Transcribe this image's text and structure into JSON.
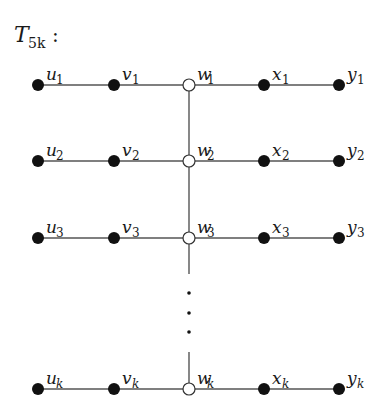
{
  "title": {
    "base": "T",
    "sub": "5k",
    "suffix": ":"
  },
  "columns": [
    {
      "letter": "u",
      "x": 38,
      "filled": true
    },
    {
      "letter": "v",
      "x": 114,
      "filled": true
    },
    {
      "letter": "w",
      "x": 189,
      "filled": false
    },
    {
      "letter": "x",
      "x": 264,
      "filled": true
    },
    {
      "letter": "y",
      "x": 339,
      "filled": true
    }
  ],
  "rows": [
    {
      "index": "1",
      "y": 85
    },
    {
      "index": "2",
      "y": 161
    },
    {
      "index": "3",
      "y": 238
    },
    {
      "index": "k",
      "y": 389
    }
  ],
  "spine": {
    "x": 189,
    "segments": [
      [
        85,
        274
      ],
      [
        352,
        389
      ]
    ],
    "ellipsis_dots_y": [
      293,
      313,
      332
    ]
  },
  "colors": {
    "edge": "#555555",
    "filled_node": "#111111",
    "open_node_fill": "#ffffff",
    "open_node_stroke": "#333333"
  }
}
